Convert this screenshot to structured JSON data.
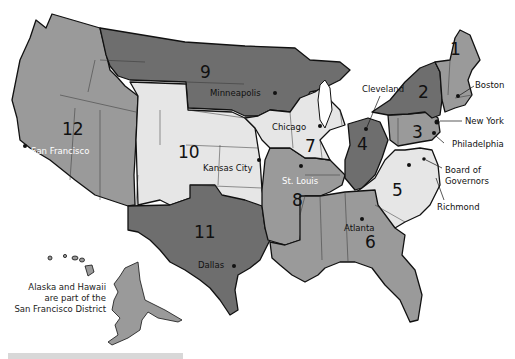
{
  "colors": {
    "dark": "#6e6e6e",
    "medium": "#9a9a9a",
    "light": "#e6e6e6",
    "lightmid": "#c9c9c9",
    "border": "#111111"
  },
  "districts": [
    {
      "number": "1",
      "city": "Boston",
      "shade": "medium"
    },
    {
      "number": "2",
      "city": "New York",
      "shade": "dark"
    },
    {
      "number": "3",
      "city": "Philadelphia",
      "shade": "medium"
    },
    {
      "number": "4",
      "city": "Cleveland",
      "shade": "dark"
    },
    {
      "number": "5",
      "city": "Richmond",
      "shade": "light"
    },
    {
      "number": "6",
      "city": "Atlanta",
      "shade": "medium"
    },
    {
      "number": "7",
      "city": "Chicago",
      "shade": "light"
    },
    {
      "number": "8",
      "city": "St. Louis",
      "shade": "medium"
    },
    {
      "number": "9",
      "city": "Minneapolis",
      "shade": "dark"
    },
    {
      "number": "10",
      "city": "Kansas City",
      "shade": "light"
    },
    {
      "number": "11",
      "city": "Dallas",
      "shade": "dark"
    },
    {
      "number": "12",
      "city": "San Francisco",
      "shade": "medium"
    }
  ],
  "labels": {
    "board": "Board of",
    "board2": "Governors",
    "note1": "Alaska and Hawaii",
    "note2": "are part of the",
    "note3": "San Francisco District"
  }
}
